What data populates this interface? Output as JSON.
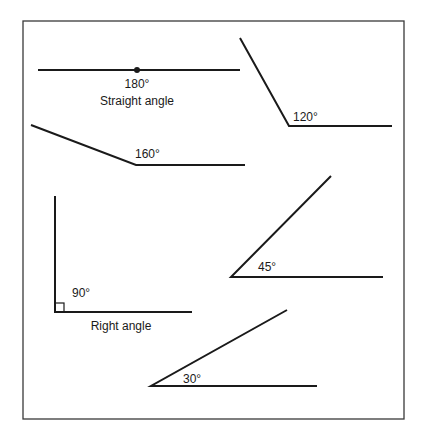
{
  "figure": {
    "frame": {
      "x1": 23,
      "y1": 21,
      "x2": 404,
      "y2": 419
    },
    "stroke_color": "#1a1a1a",
    "frame_color": "#3a3a3a",
    "angles": [
      {
        "id": "straight",
        "degrees": 180,
        "label": "180°",
        "caption": "Straight angle",
        "vertex": [
          137,
          70
        ],
        "ray_a": [
          38,
          70
        ],
        "ray_b": [
          240,
          70
        ],
        "label_pos": [
          137,
          88
        ],
        "caption_pos": [
          137,
          105
        ],
        "has_vertex_dot": true
      },
      {
        "id": "obtuse-120",
        "degrees": 120,
        "label": "120°",
        "vertex": [
          289,
          126
        ],
        "ray_a": [
          240,
          38
        ],
        "ray_b": [
          392,
          126
        ],
        "label_pos": [
          293,
          121
        ]
      },
      {
        "id": "obtuse-160",
        "degrees": 160,
        "label": "160°",
        "vertex": [
          136,
          165
        ],
        "ray_a": [
          31,
          125
        ],
        "ray_b": [
          245,
          165
        ],
        "label_pos": [
          135,
          158
        ]
      },
      {
        "id": "right",
        "degrees": 90,
        "label": "90°",
        "caption": "Right angle",
        "vertex": [
          55,
          312
        ],
        "ray_a": [
          55,
          196
        ],
        "ray_b": [
          192,
          312
        ],
        "label_pos": [
          72,
          297
        ],
        "caption_pos": [
          121,
          330
        ],
        "has_square_marker": true
      },
      {
        "id": "acute-45",
        "degrees": 45,
        "label": "45°",
        "vertex": [
          231,
          277
        ],
        "ray_a": [
          331,
          176
        ],
        "ray_b": [
          383,
          277
        ],
        "label_pos": [
          258,
          271
        ]
      },
      {
        "id": "acute-30",
        "degrees": 30,
        "label": "30°",
        "vertex": [
          151,
          386
        ],
        "ray_a": [
          287,
          310
        ],
        "ray_b": [
          317,
          386
        ],
        "label_pos": [
          183,
          383
        ]
      }
    ]
  }
}
